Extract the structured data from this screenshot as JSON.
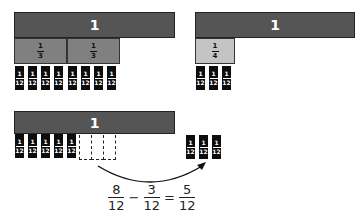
{
  "diagram": {
    "panel_a": {
      "whole_label": "1",
      "parts": [
        {
          "numerator": "1",
          "denominator": "3"
        },
        {
          "numerator": "1",
          "denominator": "3"
        }
      ],
      "twelfths": [
        {
          "numerator": "1",
          "denominator": "12"
        },
        {
          "numerator": "1",
          "denominator": "12"
        },
        {
          "numerator": "1",
          "denominator": "12"
        },
        {
          "numerator": "1",
          "denominator": "12"
        },
        {
          "numerator": "1",
          "denominator": "12"
        },
        {
          "numerator": "1",
          "denominator": "12"
        },
        {
          "numerator": "1",
          "denominator": "12"
        },
        {
          "numerator": "1",
          "denominator": "12"
        }
      ]
    },
    "panel_b": {
      "whole_label": "1",
      "parts": [
        {
          "numerator": "1",
          "denominator": "4"
        }
      ],
      "twelfths": [
        {
          "numerator": "1",
          "denominator": "12"
        },
        {
          "numerator": "1",
          "denominator": "12"
        },
        {
          "numerator": "1",
          "denominator": "12"
        }
      ]
    },
    "panel_c": {
      "whole_label": "1",
      "remaining_twelfths": [
        {
          "numerator": "1",
          "denominator": "12"
        },
        {
          "numerator": "1",
          "denominator": "12"
        },
        {
          "numerator": "1",
          "denominator": "12"
        },
        {
          "numerator": "1",
          "denominator": "12"
        },
        {
          "numerator": "1",
          "denominator": "12"
        }
      ],
      "removed_count": 3,
      "moved_twelfths": [
        {
          "numerator": "1",
          "denominator": "12"
        },
        {
          "numerator": "1",
          "denominator": "12"
        },
        {
          "numerator": "1",
          "denominator": "12"
        }
      ]
    },
    "equation": {
      "term1": {
        "numerator": "8",
        "denominator": "12"
      },
      "operator": "−",
      "term2": {
        "numerator": "3",
        "denominator": "12"
      },
      "equals": "=",
      "result": {
        "numerator": "5",
        "denominator": "12"
      }
    },
    "colors": {
      "whole_bar": "#555555",
      "third": "#808080",
      "quarter": "#c4c4c4",
      "twelfth": "#0d0d0d"
    }
  }
}
